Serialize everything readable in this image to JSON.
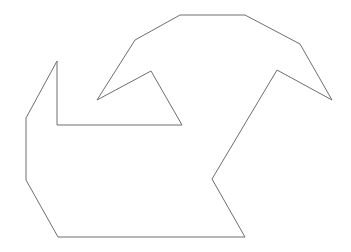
{
  "canvas": {
    "width": 351,
    "height": 252,
    "background_color": "#ffffff",
    "description": "line-drawing-polygon"
  },
  "shape": {
    "name": "closed-polygon-outline",
    "stroke_color": "#6e6e6e",
    "fill_color": "none",
    "stroke_width": 1,
    "closed": true,
    "vertex_count": 16,
    "points": [
      [
        57,
        61
      ],
      [
        57,
        125
      ],
      [
        182,
        125
      ],
      [
        151,
        71
      ],
      [
        97,
        100
      ],
      [
        135,
        40
      ],
      [
        180,
        15
      ],
      [
        245,
        15
      ],
      [
        300,
        44
      ],
      [
        332,
        100
      ],
      [
        277,
        70
      ],
      [
        212,
        179
      ],
      [
        245,
        237
      ],
      [
        58,
        237
      ],
      [
        26,
        180
      ],
      [
        26,
        118
      ]
    ],
    "points_string": "57,61 57,125 182,125 151,71 97,100 135,40 180,15 245,15 300,44 332,100 277,70 212,179 245,237 58,237 26,180 26,118"
  }
}
